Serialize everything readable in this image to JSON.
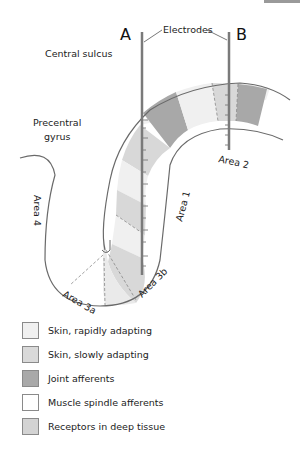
{
  "diagram": {
    "electrode_a": "A",
    "electrode_b": "B",
    "electrodes_label": "Electrodes",
    "central_sulcus": "Central sulcus",
    "precentral_gyrus_line1": "Precentral",
    "precentral_gyrus_line2": "gyrus",
    "area4": "Area 4",
    "area3a": "Area 3a",
    "area3b": "Area 3b",
    "area1": "Area 1",
    "area2": "Area 2"
  },
  "colors": {
    "skin_rapid": "#f0f0f0",
    "skin_slow": "#d8d8d8",
    "joint": "#a8a8a8",
    "muscle_spindle": "#ffffff",
    "deep_tissue": "#cfcfcf",
    "outline": "#6a6a6a",
    "electrode": "#7a7a7a"
  },
  "legend": [
    {
      "label": "Skin, rapidly adapting",
      "color": "#f0f0f0"
    },
    {
      "label": "Skin, slowly adapting",
      "color": "#d9d9d9"
    },
    {
      "label": "Joint afferents",
      "color": "#a9a9a9"
    },
    {
      "label": "Muscle spindle afferents",
      "color": "#ffffff"
    },
    {
      "label": "Receptors in deep tissue",
      "color": "#d3d3d3"
    }
  ]
}
